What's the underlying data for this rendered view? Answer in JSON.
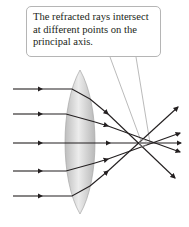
{
  "callout": {
    "text": "The refracted rays intersect at different points on the principal axis."
  },
  "diagram": {
    "ray_count": 5,
    "colors": {
      "ray": "#231f20",
      "lens_fill": "#cfcfcf",
      "lens_edge": "#a8a8a8",
      "callout_border": "#b5b5b5"
    }
  }
}
